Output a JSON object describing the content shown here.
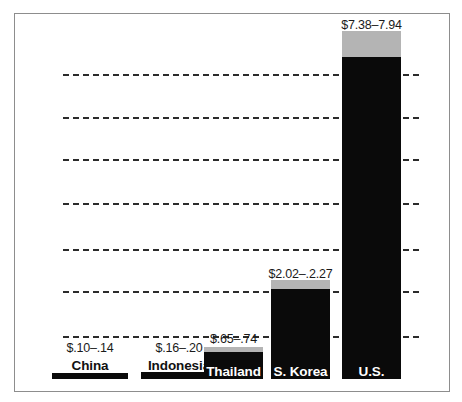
{
  "chart_data": {
    "type": "bar",
    "title": "",
    "subtitle": "",
    "xlabel": "",
    "ylabel": "",
    "ylim": [
      0,
      8
    ],
    "grid": true,
    "gridlines": [
      1,
      2,
      3,
      4,
      5,
      6,
      7
    ],
    "legend": "none",
    "value_unit": "USD per hour",
    "categories": [
      "China",
      "Indonesia",
      "Thailand",
      "S. Korea",
      "U.S."
    ],
    "value_labels": [
      "$.10–.14",
      "$.16–.20",
      "$.65–.74",
      "$2.02–.2.27",
      "$7.38–7.94"
    ],
    "low_values": [
      0.1,
      0.16,
      0.65,
      2.02,
      7.38
    ],
    "high_values": [
      0.14,
      0.2,
      0.74,
      2.27,
      7.94
    ],
    "series": [
      {
        "name": "Low end of range",
        "values": [
          0.1,
          0.16,
          0.65,
          2.02,
          7.38
        ]
      },
      {
        "name": "High end of range",
        "values": [
          0.14,
          0.2,
          0.74,
          2.27,
          7.94
        ]
      }
    ],
    "bar_fill_color": "#0a0a0a",
    "bar_cap_color": "#b4b4b4",
    "gridline_color": "#2b2b2b",
    "frame_color": "#8d8d8d",
    "background_color": "#ffffff"
  },
  "bars": [
    {
      "category": "China",
      "value_label": "$.10–.14",
      "label_placement": "above",
      "left": 51,
      "width": 76,
      "body_height": 6,
      "cap_height": 0,
      "value_top": 340,
      "name_top": 357
    },
    {
      "category": "Indonesia",
      "value_label": "$.16–.20",
      "label_placement": "above",
      "left": 140,
      "width": 76,
      "body_height": 7,
      "cap_height": 0,
      "value_top": 340,
      "name_top": 357
    },
    {
      "category": "Thailand",
      "value_label": "$.65–.74",
      "label_placement": "inside",
      "left": 203,
      "width": 59,
      "body_height": 27,
      "cap_height": 5,
      "value_top": 331,
      "name_top": 363
    },
    {
      "category": "S. Korea",
      "value_label": "$2.02–.2.27",
      "label_placement": "inside",
      "left": 270,
      "width": 59,
      "body_height": 90,
      "cap_height": 9,
      "value_top": 266,
      "name_top": 363
    },
    {
      "category": "U.S.",
      "value_label": "$7.38–7.94",
      "label_placement": "inside",
      "left": 341,
      "width": 59,
      "body_height": 322,
      "cap_height": 26,
      "value_top": 17,
      "name_top": 363
    }
  ],
  "gridlines": [
    {
      "top": 73
    },
    {
      "top": 116
    },
    {
      "top": 158
    },
    {
      "top": 202
    },
    {
      "top": 248
    },
    {
      "top": 290
    },
    {
      "top": 335
    }
  ]
}
